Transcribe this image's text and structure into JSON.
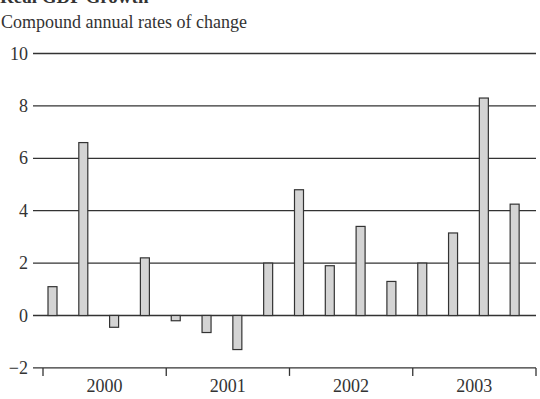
{
  "chart_data": {
    "type": "bar",
    "title": "Real GDP Growth",
    "subtitle": "Compound annual rates of change",
    "xlabel": "",
    "ylabel": "",
    "ylim": [
      -2,
      10
    ],
    "yticks": [
      -2,
      0,
      2,
      4,
      6,
      8,
      10
    ],
    "ytick_labels": [
      "−2",
      "0",
      "2",
      "4",
      "6",
      "8",
      "10"
    ],
    "grid": true,
    "legend": null,
    "year_labels": [
      "2000",
      "2001",
      "2002",
      "2003"
    ],
    "categories": [
      "2000 Q1",
      "2000 Q2",
      "2000 Q3",
      "2000 Q4",
      "2001 Q1",
      "2001 Q2",
      "2001 Q3",
      "2001 Q4",
      "2002 Q1",
      "2002 Q2",
      "2002 Q3",
      "2002 Q4",
      "2003 Q1",
      "2003 Q2",
      "2003 Q3",
      "2003 Q4"
    ],
    "values": [
      1.1,
      6.6,
      -0.45,
      2.2,
      -0.2,
      -0.65,
      -1.3,
      2.0,
      4.8,
      1.9,
      3.4,
      1.3,
      2.0,
      3.15,
      8.3,
      4.25
    ],
    "colors": {
      "bar_fill": "#d4d4d4",
      "bar_stroke": "#333333",
      "grid": "#333333"
    }
  }
}
